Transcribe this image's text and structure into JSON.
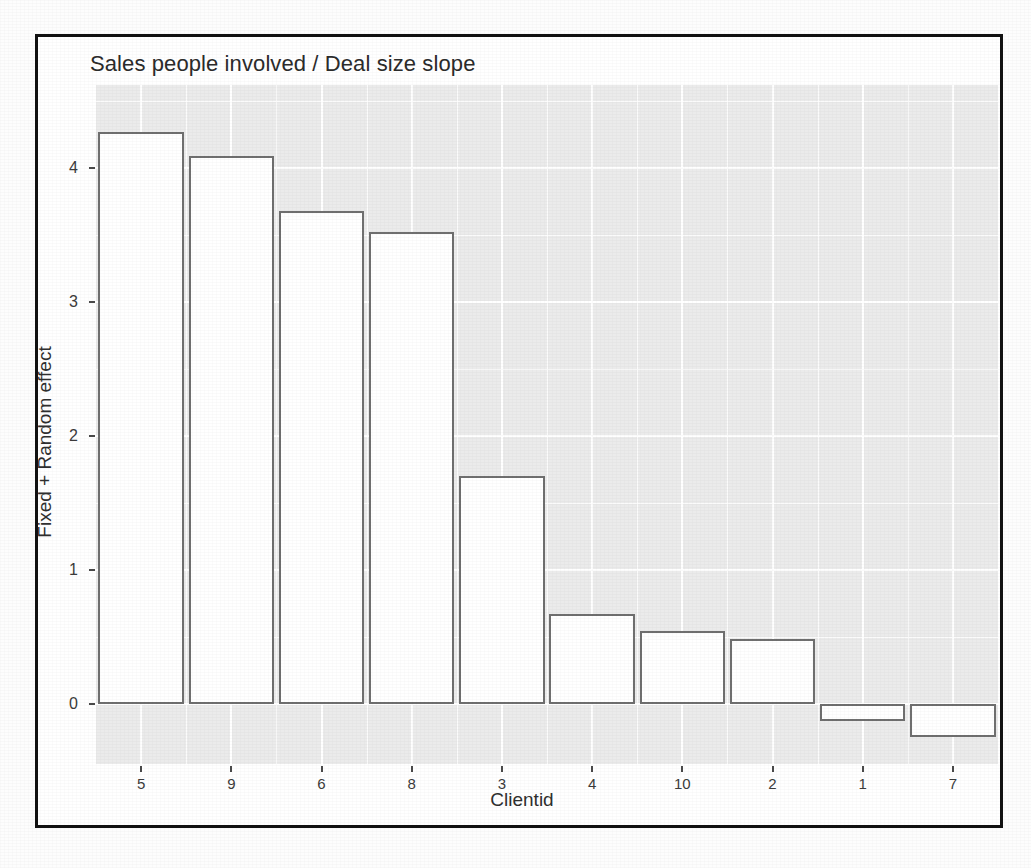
{
  "figure": {
    "title": "Sales people involved / Deal size slope"
  },
  "chart_data": {
    "type": "bar",
    "title": "Sales people involved / Deal size slope",
    "xlabel": "Clientid",
    "ylabel": "Fixed + Random effect",
    "categories": [
      "5",
      "9",
      "6",
      "8",
      "3",
      "4",
      "10",
      "2",
      "1",
      "7"
    ],
    "values": [
      4.27,
      4.09,
      3.68,
      3.52,
      1.7,
      0.67,
      0.54,
      0.48,
      -0.13,
      -0.25
    ],
    "ylim": [
      -0.45,
      4.62
    ],
    "yticks": [
      "0",
      "1",
      "2",
      "3",
      "4"
    ],
    "ytick_values": [
      0,
      1,
      2,
      3,
      4
    ],
    "grid": true,
    "legend": "none",
    "bar_fill": "#ffffff",
    "bar_outline": "#6f6f6f",
    "panel_background": "#ebebeb",
    "gridline_color": "#ffffff"
  }
}
